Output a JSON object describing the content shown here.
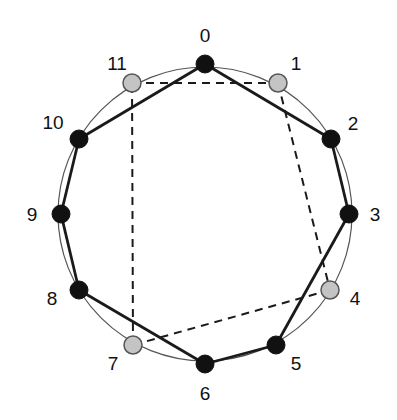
{
  "diagram": {
    "circle": {
      "cx": 205,
      "cy": 214,
      "r": 147,
      "stroke": "#555555"
    },
    "colors": {
      "dark_node": "#111111",
      "light_node_fill": "#c4c4c4",
      "light_node_stroke": "#555555",
      "solid_edge": "#1a1a1a",
      "dashed_edge": "#1a1a1a",
      "label": "#111111"
    },
    "nodes": [
      {
        "id": 0,
        "label": "0",
        "x": 205,
        "y": 64,
        "type": "dark",
        "lx": 205,
        "ly": 42
      },
      {
        "id": 1,
        "label": "1",
        "x": 278,
        "y": 83,
        "type": "light",
        "lx": 296,
        "ly": 70
      },
      {
        "id": 2,
        "label": "2",
        "x": 331,
        "y": 139,
        "type": "dark",
        "lx": 353,
        "ly": 130
      },
      {
        "id": 3,
        "label": "3",
        "x": 349,
        "y": 214,
        "type": "dark",
        "lx": 375,
        "ly": 221
      },
      {
        "id": 4,
        "label": "4",
        "x": 330,
        "y": 290,
        "type": "light",
        "lx": 355,
        "ly": 305
      },
      {
        "id": 5,
        "label": "5",
        "x": 276,
        "y": 345,
        "type": "dark",
        "lx": 296,
        "ly": 370
      },
      {
        "id": 6,
        "label": "6",
        "x": 205,
        "y": 364,
        "type": "dark",
        "lx": 205,
        "ly": 400
      },
      {
        "id": 7,
        "label": "7",
        "x": 133,
        "y": 345,
        "type": "light",
        "lx": 113,
        "ly": 370
      },
      {
        "id": 8,
        "label": "8",
        "x": 79,
        "y": 290,
        "type": "dark",
        "lx": 52,
        "ly": 305
      },
      {
        "id": 9,
        "label": "9",
        "x": 61,
        "y": 214,
        "type": "dark",
        "lx": 32,
        "ly": 221
      },
      {
        "id": 10,
        "label": "10",
        "x": 79,
        "y": 139,
        "type": "dark",
        "lx": 53,
        "ly": 129
      },
      {
        "id": 11,
        "label": "11",
        "x": 132,
        "y": 83,
        "type": "light",
        "lx": 117,
        "ly": 70
      }
    ],
    "solid_polygon": [
      0,
      2,
      3,
      5,
      6,
      8,
      9,
      10
    ],
    "dashed_polygon": [
      11,
      1,
      4,
      7
    ]
  }
}
